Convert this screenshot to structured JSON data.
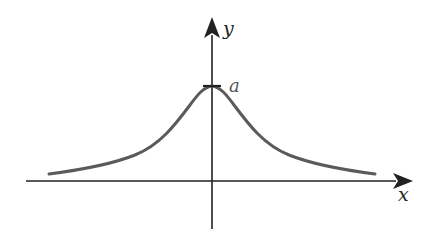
{
  "diagram": {
    "type": "function-graph",
    "axes": {
      "x_label": "x",
      "y_label": "y"
    },
    "curve": {
      "peak_label": "a",
      "shape": "bell (witch of Agnesi)",
      "peak_tick": true
    },
    "colors": {
      "axis": "#222222",
      "curve": "#5a5a5a",
      "label": "#222222",
      "peak_label": "#555555"
    }
  }
}
